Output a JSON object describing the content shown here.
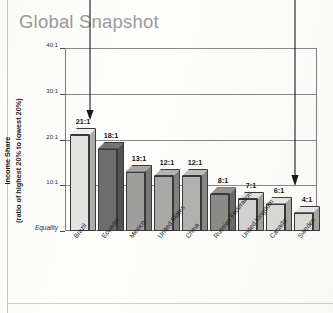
{
  "page": {
    "title": "Global Snapshot"
  },
  "chart_data": {
    "type": "bar",
    "title": "Global Snapshot",
    "xlabel": "",
    "ylabel": "Income Share (ratio of highest 20% to lowest 20%)",
    "ylabel_line1": "Income Share",
    "ylabel_line2": "(ratio of highest 20% to lowest 20%)",
    "ylim": [
      0,
      40
    ],
    "grid": true,
    "legend": "none",
    "ytick_values": [
      40,
      30,
      20,
      10,
      0
    ],
    "ytick_labels": [
      "40:1",
      "30:1",
      "20:1",
      "10:1",
      "Equality"
    ],
    "categories": [
      "Brazil",
      "Ecuador",
      "Mexico",
      "United States",
      "China",
      "Russian Federation",
      "United Kingdom",
      "Canada",
      "Sweden"
    ],
    "values": [
      21,
      18,
      13,
      12,
      12,
      8,
      7,
      6,
      4
    ],
    "value_labels": [
      "21:1",
      "18:1",
      "13:1",
      "12:1",
      "12:1",
      "8:1",
      "7:1",
      "6:1",
      "4:1"
    ],
    "bar_colors": [
      "#e3e3e1",
      "#6d6d6d",
      "#9e9e9c",
      "#a9a9a7",
      "#b1b1af",
      "#8b8b89",
      "#d3d3d1",
      "#d9d9d7",
      "#dcdcda"
    ]
  },
  "annotations": [
    {
      "name": "arrow-to-brazil",
      "target": "Brazil",
      "direction": "down"
    },
    {
      "name": "arrow-to-sweden",
      "target": "Sweden",
      "direction": "down"
    }
  ]
}
